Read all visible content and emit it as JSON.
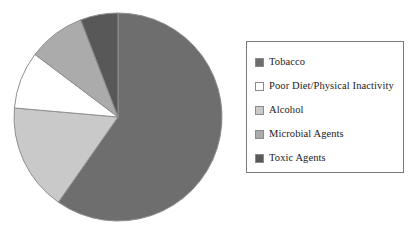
{
  "chart_data": {
    "type": "pie",
    "title": "",
    "subtitle": "",
    "xlabel": "",
    "ylabel": "",
    "grid": false,
    "legend_position": "right",
    "start_angle_deg": 0,
    "direction": "clockwise",
    "center": {
      "x": 118,
      "y": 117
    },
    "radius": 104,
    "categories": [
      "Tobacco",
      "Poor Diet/Physical Inactivity",
      "Alcohol",
      "Microbial Agents",
      "Toxic Agents"
    ],
    "values": [
      59.7,
      8.9,
      16.7,
      8.9,
      5.8
    ],
    "value_unit": "percent",
    "slices": [
      {
        "label": "Tobacco",
        "value": 59.7,
        "color": "#6e6e6e",
        "start_deg": 0,
        "end_deg": 215,
        "swatch": "filled-dark-gray"
      },
      {
        "label": "Alcohol",
        "value": 16.7,
        "color": "#c9c9c9",
        "start_deg": 215,
        "end_deg": 275,
        "swatch": "filled-light-gray"
      },
      {
        "label": "Poor Diet/Physical Inactivity",
        "value": 8.9,
        "color": "#ffffff",
        "start_deg": 275,
        "end_deg": 307,
        "swatch": "outline-white"
      },
      {
        "label": "Microbial Agents",
        "value": 8.9,
        "color": "#ababab",
        "start_deg": 307,
        "end_deg": 339,
        "swatch": "filled-medium-gray"
      },
      {
        "label": "Toxic Agents",
        "value": 5.8,
        "color": "#585858",
        "start_deg": 339,
        "end_deg": 360,
        "swatch": "filled-darkest-gray"
      }
    ]
  },
  "legend": {
    "border_color": "#7a7a7a",
    "items": [
      {
        "label": "Tobacco",
        "color": "#6e6e6e"
      },
      {
        "label": "Poor Diet/Physical Inactivity",
        "color": "#ffffff"
      },
      {
        "label": "Alcohol",
        "color": "#c9c9c9"
      },
      {
        "label": "Microbial Agents",
        "color": "#ababab"
      },
      {
        "label": "Toxic Agents",
        "color": "#585858"
      }
    ]
  },
  "colors": {
    "background": "#ffffff",
    "slice_outline": "#8f8f8f",
    "text": "#1a1a1a"
  }
}
